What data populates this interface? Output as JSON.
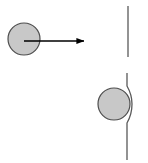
{
  "figure": {
    "title": "Ball approaching a vertical line and deflecting it",
    "width": 148,
    "height": 163,
    "background_color": "#ffffff",
    "stroke_color": "#595959",
    "arrow_color": "#000000",
    "circle_fill_color": "#c8c8c8",
    "circle_stroke_color": "#4d4d4d",
    "panels": [
      {
        "name": "before",
        "label": "",
        "elements": [
          {
            "type": "circle",
            "name": "moving-ball",
            "cx": 24,
            "cy": 39,
            "r": 16,
            "fill": "#c8c8c8",
            "stroke": "#4d4d4d",
            "stroke_width": 1.2
          },
          {
            "type": "arrow",
            "name": "velocity-arrow",
            "x1": 24,
            "y1": 41,
            "x2": 85,
            "y2": 41,
            "stroke": "#000000",
            "stroke_width": 1.3,
            "head_length": 7,
            "head_width": 5
          },
          {
            "type": "line",
            "name": "straight-vertical-line",
            "x1": 128,
            "y1": 6,
            "x2": 128,
            "y2": 57,
            "stroke": "#595959",
            "stroke_width": 1.3
          }
        ]
      },
      {
        "name": "after",
        "label": "",
        "elements": [
          {
            "type": "circle",
            "name": "contact-ball",
            "cx": 114,
            "cy": 104,
            "r": 16,
            "fill": "#c8c8c8",
            "stroke": "#4d4d4d",
            "stroke_width": 1.2
          },
          {
            "type": "curve",
            "name": "deflected-vertical-line",
            "path": "M 127 73 L 127 86 C 131 93 132 99 132 104 C 132 110 131 116 127 123 L 127 160",
            "stroke": "#595959",
            "stroke_width": 1.3
          }
        ]
      }
    ]
  }
}
